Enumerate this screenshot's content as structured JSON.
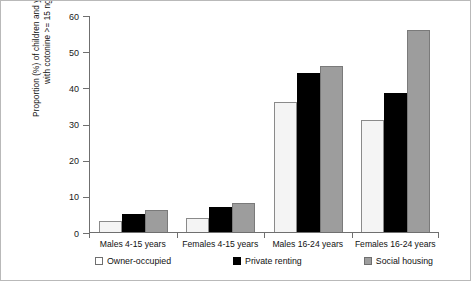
{
  "chart_data": {
    "type": "bar",
    "title": "",
    "xlabel": "",
    "ylabel_line1": "Proportion (%) of children and young adults",
    "ylabel_line2": "with cotonine >= 15 ng/ml",
    "categories": [
      "Males 4-15 years",
      "Females 4-15 years",
      "Males 16-24 years",
      "Females 16-24 years"
    ],
    "series": [
      {
        "name": "Owner-occupied",
        "color": "#f4f4f4",
        "values": [
          3,
          4,
          36,
          31
        ]
      },
      {
        "name": "Private renting",
        "color": "#000000",
        "values": [
          5,
          7,
          44,
          38.5
        ]
      },
      {
        "name": "Social housing",
        "color": "#9d9d9d",
        "values": [
          6,
          8,
          46,
          55.8
        ]
      }
    ],
    "ylim": [
      0,
      60
    ],
    "yticks": [
      0,
      10,
      20,
      30,
      40,
      50,
      60
    ],
    "ytick_labels": [
      "0",
      "10",
      "20",
      "30",
      "40",
      "50",
      "60"
    ],
    "grid": false,
    "legend_position": "bottom"
  },
  "legend": {
    "items": [
      {
        "label": "Owner-occupied",
        "swatch": "owner-occupied-swatch"
      },
      {
        "label": "Private renting",
        "swatch": "private-renting-swatch"
      },
      {
        "label": "Social housing",
        "swatch": "social-housing-swatch"
      }
    ]
  }
}
